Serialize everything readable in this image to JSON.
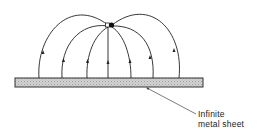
{
  "diagram": {
    "label": {
      "line1": "Infinite",
      "line2": "metal sheet"
    },
    "colors": {
      "line": "#222222",
      "sheet_fill": "#c8c8c8",
      "background": "#ffffff"
    },
    "charge": {
      "x": 110,
      "y": 25
    },
    "sheet": {
      "x": 15,
      "y": 78,
      "width": 188,
      "height": 9
    },
    "field_line_feet_x": [
      39,
      62,
      87,
      108,
      131,
      153,
      179
    ]
  }
}
